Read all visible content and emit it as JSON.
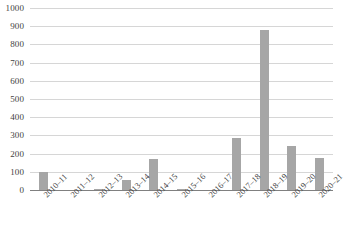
{
  "chart_data": {
    "type": "bar",
    "title": "",
    "subtitle": "",
    "xlabel": "",
    "ylabel": "",
    "categories": [
      "2010–11",
      "2011–12",
      "2012–13",
      "2013–14",
      "2014–15",
      "2015–16",
      "2016–17",
      "2017–18",
      "2018–19",
      "2019–20",
      "2020–21"
    ],
    "values": [
      100,
      0,
      8,
      55,
      170,
      4,
      0,
      285,
      880,
      240,
      175
    ],
    "ylim": [
      0,
      1000
    ],
    "yticks": [
      0,
      100,
      200,
      300,
      400,
      500,
      600,
      700,
      800,
      900,
      1000
    ],
    "ytick_labels": [
      "0",
      "100",
      "200",
      "300",
      "400",
      "500",
      "600",
      "700",
      "800",
      "900",
      "1000"
    ],
    "grid": true,
    "legend": null,
    "bar_color": "#a6a6a6",
    "gridline_color": "#d6d6d6",
    "axis_color": "#808080",
    "background": "#ffffff"
  }
}
